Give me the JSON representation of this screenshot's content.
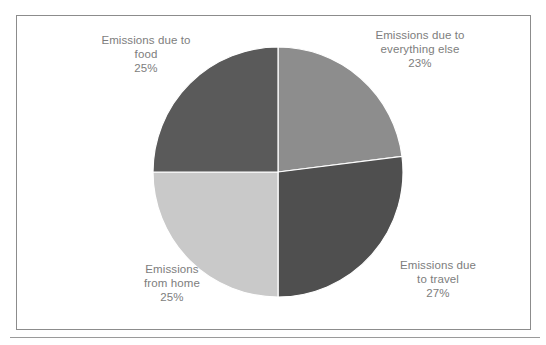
{
  "figure": {
    "frame_border_color": "#8c8c8c",
    "background_color": "#ffffff",
    "label_text_color": "#7d7d7d",
    "has_bottom_rule": true
  },
  "chart_data": {
    "type": "pie",
    "title": "",
    "subtitle": "",
    "xlabel": "",
    "ylabel": "",
    "legend_position": "none",
    "grid": false,
    "start_angle_deg": 90,
    "direction": "clockwise",
    "center": {
      "x": 278,
      "y": 172
    },
    "radius": 125,
    "categories": [
      "Emissions due to everything else",
      "Emissions due to travel",
      "Emissions from home",
      "Emissions due to food"
    ],
    "values": [
      23,
      27,
      25,
      25
    ],
    "value_unit": "%",
    "colors": [
      "#8d8d8d",
      "#4f4f4f",
      "#c9c9c9",
      "#5a5a5a"
    ],
    "slices": [
      {
        "name": "everything-else",
        "label_lines": [
          "Emissions due to",
          "everything else"
        ],
        "percent_text": "23%",
        "value": 23,
        "color": "#8d8d8d",
        "start_deg": 0,
        "end_deg": 82.8
      },
      {
        "name": "travel",
        "label_lines": [
          "Emissions due",
          "to travel"
        ],
        "percent_text": "27%",
        "value": 27,
        "color": "#4f4f4f",
        "start_deg": 82.8,
        "end_deg": 180
      },
      {
        "name": "home",
        "label_lines": [
          "Emissions",
          "from home"
        ],
        "percent_text": "25%",
        "value": 25,
        "color": "#c9c9c9",
        "start_deg": 180,
        "end_deg": 270
      },
      {
        "name": "food",
        "label_lines": [
          "Emissions due to",
          "food"
        ],
        "percent_text": "25%",
        "value": 25,
        "color": "#5a5a5a",
        "start_deg": 270,
        "end_deg": 360
      }
    ]
  },
  "labels": {
    "everything_else": {
      "line1": "Emissions due to",
      "line2": "everything else",
      "percent": "23%"
    },
    "food": {
      "line1": "Emissions due to",
      "line2": "food",
      "percent": "25%"
    },
    "travel": {
      "line1": "Emissions due",
      "line2": "to travel",
      "percent": "27%"
    },
    "home": {
      "line1": "Emissions",
      "line2": "from home",
      "percent": "25%"
    }
  }
}
